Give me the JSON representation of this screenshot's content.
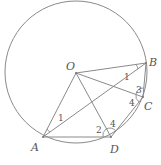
{
  "diagram": {
    "type": "circle-geometry",
    "circle": {
      "center": "O",
      "cx": 76,
      "cy": 72,
      "r": 71
    },
    "points": {
      "O": {
        "label": "O",
        "x": 76,
        "y": 73
      },
      "A": {
        "label": "A",
        "x": 43,
        "y": 137
      },
      "B": {
        "label": "B",
        "x": 146,
        "y": 63
      },
      "C": {
        "label": "C",
        "x": 143,
        "y": 97
      },
      "D": {
        "label": "D",
        "x": 111,
        "y": 137
      }
    },
    "segments": [
      "OA",
      "OB",
      "OC",
      "OD",
      "AB",
      "AD",
      "BC",
      "CD"
    ],
    "angle_labels": [
      {
        "label": "1",
        "at": "B",
        "between": "OB,AB"
      },
      {
        "label": "1",
        "at": "A",
        "between": "OA,AB"
      },
      {
        "label": "2",
        "at": "D",
        "between": "OD,AD"
      },
      {
        "label": "4",
        "at": "D",
        "between": "OD,CD"
      },
      {
        "label": "3",
        "at": "C",
        "between": "BC,OC"
      },
      {
        "label": "4",
        "at": "C",
        "between": "OC,CD"
      }
    ]
  }
}
